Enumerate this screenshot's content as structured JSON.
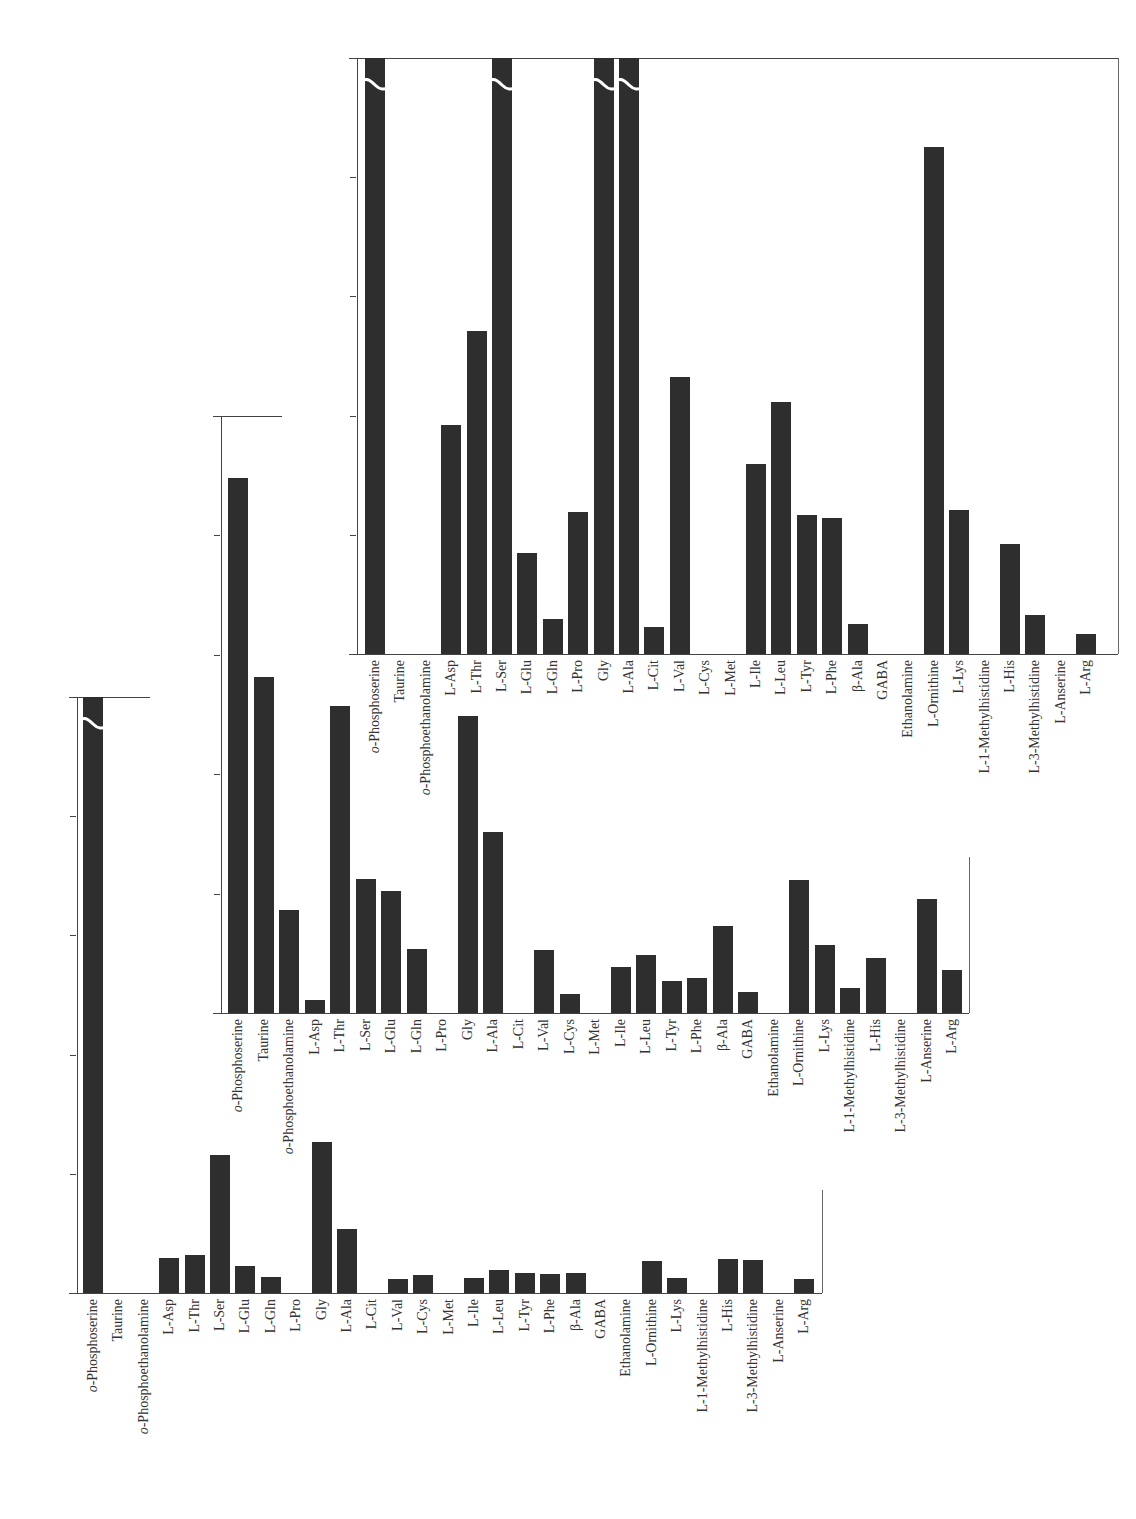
{
  "figure": {
    "y_axis_label": "Concentration（nM）",
    "y_ticks": [
      "0",
      "2",
      "4",
      "6",
      "8",
      "10"
    ],
    "categories": [
      "o-Phosphoserine",
      "Taurine",
      "o-Phosphoethanolamine",
      "L-Asp",
      "L-Thr",
      "L-Ser",
      "L-Glu",
      "L-Gln",
      "L-Pro",
      "Gly",
      "L-Ala",
      "L-Cit",
      "L-Val",
      "L-Cys",
      "L-Met",
      "L-Ile",
      "L-Leu",
      "L-Tyr",
      "L-Phe",
      "β-Ala",
      "GABA",
      "Ethanolamine",
      "L-Ornithine",
      "L-Lys",
      "L-1-Methylhistidine",
      "L-His",
      "L-3-Methylhistidine",
      "L-Anserine",
      "L-Arg"
    ],
    "bar_color": "#2e2e2e"
  },
  "chart_data": [
    {
      "type": "bar",
      "title": "ポロモイ川",
      "xlabel": "",
      "ylabel": "Concentration（nM）",
      "ylim": [
        0,
        10
      ],
      "grid": false,
      "categories": [
        "o-Phosphoserine",
        "Taurine",
        "o-Phosphoethanolamine",
        "L-Asp",
        "L-Thr",
        "L-Ser",
        "L-Glu",
        "L-Gln",
        "L-Pro",
        "Gly",
        "L-Ala",
        "L-Cit",
        "L-Val",
        "L-Cys",
        "L-Met",
        "L-Ile",
        "L-Leu",
        "L-Tyr",
        "L-Phe",
        "β-Ala",
        "GABA",
        "Ethanolamine",
        "L-Ornithine",
        "L-Lys",
        "L-1-Methylhistidine",
        "L-His",
        "L-3-Methylhistidine",
        "L-Anserine",
        "L-Arg"
      ],
      "values": [
        25.55,
        0,
        0,
        3.84,
        5.42,
        30.0,
        1.69,
        0.59,
        2.38,
        20.45,
        10.47,
        0.45,
        4.65,
        0,
        0,
        3.18,
        4.22,
        2.33,
        2.28,
        0.5,
        0,
        0,
        8.51,
        2.42,
        0,
        1.85,
        0.65,
        0,
        0.33
      ],
      "break_labels": [
        {
          "category": "o-Phosphoserine",
          "value": "25.55"
        },
        {
          "category": "L-Ser",
          "value": "30.00"
        },
        {
          "category": "Gly",
          "value": "20.45"
        },
        {
          "category": "L-Ala",
          "value": "10.47"
        }
      ]
    },
    {
      "type": "bar",
      "title": "洞爺臨湖実験所",
      "xlabel": "",
      "ylabel": "Concentration（nM）",
      "ylim": [
        0,
        10
      ],
      "grid": false,
      "categories": [
        "o-Phosphoserine",
        "Taurine",
        "o-Phosphoethanolamine",
        "L-Asp",
        "L-Thr",
        "L-Ser",
        "L-Glu",
        "L-Gln",
        "L-Pro",
        "Gly",
        "L-Ala",
        "L-Cit",
        "L-Val",
        "L-Cys",
        "L-Met",
        "L-Ile",
        "L-Leu",
        "L-Tyr",
        "L-Phe",
        "β-Ala",
        "GABA",
        "Ethanolamine",
        "L-Ornithine",
        "L-Lys",
        "L-1-Methylhistidine",
        "L-His",
        "L-3-Methylhistidine",
        "L-Anserine",
        "L-Arg"
      ],
      "values": [
        8.96,
        5.62,
        1.72,
        0.22,
        5.14,
        2.24,
        2.04,
        1.07,
        0,
        4.98,
        3.03,
        0,
        1.05,
        0.32,
        0,
        0.77,
        0.97,
        0.54,
        0.59,
        1.46,
        0.36,
        0,
        2.22,
        1.14,
        0.42,
        0.92,
        0,
        1.91,
        0.72
      ],
      "break_labels": []
    },
    {
      "type": "bar",
      "title": "ソウベツ川",
      "xlabel": "",
      "ylabel": "Concentration（nM）",
      "ylim": [
        0,
        10
      ],
      "grid": false,
      "categories": [
        "o-Phosphoserine",
        "Taurine",
        "o-Phosphoethanolamine",
        "L-Asp",
        "L-Thr",
        "L-Ser",
        "L-Glu",
        "L-Gln",
        "L-Pro",
        "Gly",
        "L-Ala",
        "L-Cit",
        "L-Val",
        "L-Cys",
        "L-Met",
        "L-Ile",
        "L-Leu",
        "L-Tyr",
        "L-Phe",
        "β-Ala",
        "GABA",
        "Ethanolamine",
        "L-Ornithine",
        "L-Lys",
        "L-1-Methylhistidine",
        "L-His",
        "L-3-Methylhistidine",
        "L-Anserine",
        "L-Arg"
      ],
      "values": [
        34.01,
        0,
        0,
        0.59,
        0.64,
        2.31,
        0.45,
        0.27,
        0,
        2.54,
        1.08,
        0,
        0.24,
        0.3,
        0,
        0.25,
        0.39,
        0.34,
        0.32,
        0.34,
        0,
        0,
        0.54,
        0.26,
        0,
        0.57,
        0.55,
        0,
        0.23
      ],
      "break_labels": [
        {
          "category": "o-Phosphoserine",
          "value": "34.01"
        }
      ]
    }
  ],
  "layout": {
    "charts": [
      {
        "axis_x": 357,
        "zero_y": 654,
        "ten_y": 58,
        "first_center": 375,
        "pitch": 25.4,
        "right_x": 1118,
        "right_top": 58,
        "top_line_end": 1118,
        "title_x": 713,
        "title_y": 152,
        "ylabel_x": 313,
        "ylabel_cy": 356
      },
      {
        "axis_x": 221,
        "zero_y": 1013,
        "ten_y": 416,
        "first_center": 238,
        "pitch": 25.5,
        "right_x": 969,
        "right_top": 857,
        "top_line_end": 282,
        "title_x": 583,
        "title_y": 765,
        "ylabel_x": 177,
        "ylabel_cy": 715
      },
      {
        "axis_x": 77,
        "zero_y": 1293,
        "ten_y": 697,
        "first_center": 93,
        "pitch": 25.4,
        "right_x": 822,
        "right_top": 1190,
        "top_line_end": 150,
        "title_x": 527,
        "title_y": 1172,
        "ylabel_x": 31,
        "ylabel_cy": 995
      }
    ]
  }
}
